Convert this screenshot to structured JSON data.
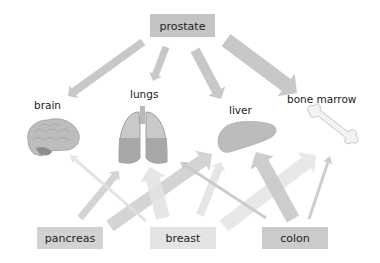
{
  "sources": {
    "prostate": {
      "label": "prostate",
      "color": "#c4c4c4"
    },
    "pancreas": {
      "label": "pancreas",
      "color": "#d2d2d2"
    },
    "breast": {
      "label": "breast",
      "color": "#e4e4e4"
    },
    "colon": {
      "label": "colon",
      "color": "#cbcbcb"
    }
  },
  "targets": {
    "brain": {
      "label": "brain"
    },
    "lungs": {
      "label": "lungs"
    },
    "liver": {
      "label": "liver"
    },
    "bone_marrow": {
      "label": "bone marrow"
    }
  },
  "arrows": [
    {
      "from": "prostate",
      "to": "brain",
      "x1": 143,
      "y1": 42,
      "x2": 68,
      "y2": 96,
      "w": 8,
      "color": "#c2c2c2"
    },
    {
      "from": "prostate",
      "to": "lungs",
      "x1": 166,
      "y1": 47,
      "x2": 153,
      "y2": 81,
      "w": 7,
      "color": "#c2c2c2"
    },
    {
      "from": "prostate",
      "to": "liver",
      "x1": 195,
      "y1": 50,
      "x2": 221,
      "y2": 99,
      "w": 10,
      "color": "#c2c2c2"
    },
    {
      "from": "prostate",
      "to": "bone_marrow",
      "x1": 226,
      "y1": 40,
      "x2": 297,
      "y2": 93,
      "w": 15,
      "color": "#c2c2c2"
    },
    {
      "from": "pancreas",
      "to": "lungs",
      "x1": 80,
      "y1": 218,
      "x2": 119,
      "y2": 171,
      "w": 7,
      "color": "#cfcfcf"
    },
    {
      "from": "pancreas",
      "to": "liver",
      "x1": 110,
      "y1": 226,
      "x2": 212,
      "y2": 154,
      "w": 13,
      "color": "#cfcfcf"
    },
    {
      "from": "breast",
      "to": "brain",
      "x1": 146,
      "y1": 221,
      "x2": 70,
      "y2": 155,
      "w": 3,
      "color": "#e0e0e0"
    },
    {
      "from": "breast",
      "to": "lungs",
      "x1": 163,
      "y1": 218,
      "x2": 150,
      "y2": 167,
      "w": 14,
      "color": "#e3e3e3"
    },
    {
      "from": "breast",
      "to": "liver",
      "x1": 200,
      "y1": 215,
      "x2": 221,
      "y2": 162,
      "w": 8,
      "color": "#e3e3e3"
    },
    {
      "from": "breast",
      "to": "bone_marrow",
      "x1": 224,
      "y1": 226,
      "x2": 316,
      "y2": 155,
      "w": 14,
      "color": "#e5e5e5"
    },
    {
      "from": "colon",
      "to": "lungs",
      "x1": 266,
      "y1": 218,
      "x2": 180,
      "y2": 162,
      "w": 3,
      "color": "#c8c8c8"
    },
    {
      "from": "colon",
      "to": "liver",
      "x1": 293,
      "y1": 219,
      "x2": 256,
      "y2": 152,
      "w": 14,
      "color": "#c8c8c8"
    },
    {
      "from": "colon",
      "to": "bone_marrow",
      "x1": 309,
      "y1": 219,
      "x2": 330,
      "y2": 156,
      "w": 3,
      "color": "#c8c8c8"
    }
  ]
}
